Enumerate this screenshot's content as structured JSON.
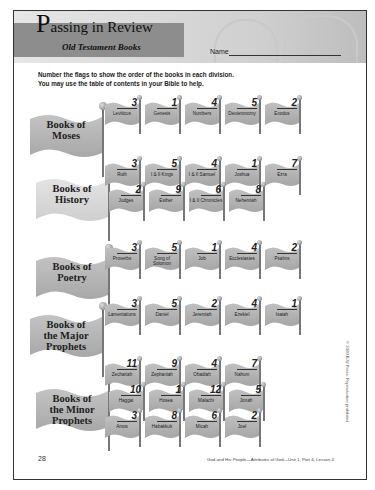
{
  "header": {
    "title_cap": "P",
    "title_rest": "assing in Review",
    "subtitle": "Old Testament Books",
    "name_label": "Name"
  },
  "instructions": {
    "line1": "Number the flags to show the order of the books in each division.",
    "line2": "You may use the table of contents in your Bible to help."
  },
  "divisions": [
    {
      "label_line1": "Books of",
      "label_line2": "Moses",
      "label_line3": "",
      "books": [
        {
          "name": "Leviticus",
          "number": "3"
        },
        {
          "name": "Genesis",
          "number": "1"
        },
        {
          "name": "Numbers",
          "number": "4"
        },
        {
          "name": "Deuteronomy",
          "number": "5"
        },
        {
          "name": "Exodus",
          "number": "2"
        }
      ]
    },
    {
      "label_line1": "Books of",
      "label_line2": "History",
      "label_line3": "",
      "books": [
        {
          "name": "Ruth",
          "number": "3"
        },
        {
          "name": "I & II Kings",
          "number": "5"
        },
        {
          "name": "I & II Samuel",
          "number": "4"
        },
        {
          "name": "Joshua",
          "number": "1"
        },
        {
          "name": "Ezra",
          "number": "7"
        },
        {
          "name": "Judges",
          "number": "2"
        },
        {
          "name": "Esther",
          "number": "9"
        },
        {
          "name": "I & II Chronicles",
          "number": "6"
        },
        {
          "name": "Nehemiah",
          "number": "8"
        }
      ]
    },
    {
      "label_line1": "Books of",
      "label_line2": "Poetry",
      "label_line3": "",
      "books": [
        {
          "name": "Proverbs",
          "number": "3"
        },
        {
          "name": "Song of Solomon",
          "number": "5"
        },
        {
          "name": "Job",
          "number": "1"
        },
        {
          "name": "Ecclesiastes",
          "number": "4"
        },
        {
          "name": "Psalms",
          "number": "2"
        }
      ]
    },
    {
      "label_line1": "Books of",
      "label_line2": "the Major",
      "label_line3": "Prophets",
      "books": [
        {
          "name": "Lamentations",
          "number": "3"
        },
        {
          "name": "Daniel",
          "number": "5"
        },
        {
          "name": "Jeremiah",
          "number": "2"
        },
        {
          "name": "Ezekiel",
          "number": "4"
        },
        {
          "name": "Isaiah",
          "number": "1"
        }
      ]
    },
    {
      "label_line1": "Books of",
      "label_line2": "the Minor",
      "label_line3": "Prophets",
      "books": [
        {
          "name": "Zechariah",
          "number": "11"
        },
        {
          "name": "Zephaniah",
          "number": "9"
        },
        {
          "name": "Obadiah",
          "number": "4"
        },
        {
          "name": "Nahum",
          "number": "7"
        },
        {
          "name": "Haggai",
          "number": "10"
        },
        {
          "name": "Hosea",
          "number": "1"
        },
        {
          "name": "Malachi",
          "number": "12"
        },
        {
          "name": "Jonah",
          "number": "5"
        },
        {
          "name": "Amos",
          "number": "3"
        },
        {
          "name": "Habakkuk",
          "number": "8"
        },
        {
          "name": "Micah",
          "number": "6"
        },
        {
          "name": "Joel",
          "number": "2"
        }
      ]
    }
  ],
  "footer": {
    "page_number": "28",
    "text": "God and His People—Attributes of God—Unit 1, Part 4, Lesson 4",
    "copyright": "© 2000 BJU Press. Reproduction prohibited."
  },
  "colors": {
    "flag_gray": "#b0b0b0",
    "title_band": "#8d8d8d",
    "border": "#333333"
  }
}
